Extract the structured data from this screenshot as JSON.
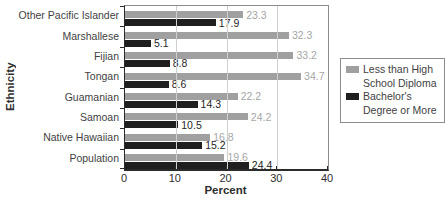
{
  "figure": {
    "ylabel": "Ethnicity",
    "xlabel": "Percent"
  },
  "colors": {
    "series_gray": "#a0a0a0",
    "series_black": "#1f1f1f",
    "value_gray": "#a6a6a6",
    "value_black": "#1f1f1f",
    "grid": "#cfcfcf",
    "axis": "#2b2b2b",
    "frame": "#8c8c8c",
    "text": "#3f3f3f"
  },
  "legend": {
    "items": [
      {
        "label": "Less than High School Diploma",
        "color_key": "series_gray"
      },
      {
        "label": "Bachelor's Degree or More",
        "color_key": "series_black"
      }
    ]
  },
  "chart_data": {
    "type": "bar",
    "orientation": "horizontal",
    "title": "",
    "xlabel": "Percent",
    "ylabel": "Ethnicity",
    "categories": [
      "Other Pacific Islander",
      "Marshallese",
      "Fijian",
      "Tongan",
      "Guamanian",
      "Samoan",
      "Native Hawaiian",
      "Population"
    ],
    "series": [
      {
        "name": "Less than High School Diploma",
        "color_key": "series_gray",
        "value_color_key": "value_gray",
        "values": [
          23.3,
          32.3,
          33.2,
          34.7,
          22.2,
          24.2,
          16.8,
          19.6
        ]
      },
      {
        "name": "Bachelor's Degree or More",
        "color_key": "series_black",
        "value_color_key": "value_black",
        "values": [
          17.9,
          5.1,
          8.8,
          8.6,
          14.3,
          10.5,
          15.2,
          24.4
        ]
      }
    ],
    "xlim": [
      0,
      40
    ],
    "xticks": [
      0,
      10,
      20,
      30,
      40
    ],
    "grid": "vertical",
    "value_labels": true,
    "legend_position": "right"
  }
}
